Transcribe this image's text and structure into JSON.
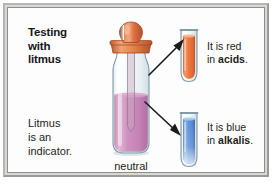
{
  "figure": {
    "title_lines": "Testing\nwith\nlitmus",
    "title_line1": "Testing",
    "title_line2": "with",
    "title_line3": "litmus",
    "subtitle_line1": "Litmus",
    "subtitle_line2": "is an",
    "subtitle_line3": "indicator.",
    "bottle_label": "neutral"
  },
  "callouts": [
    {
      "id": "acid",
      "line1": "It is red",
      "line2_prefix": "in ",
      "line2_bold": "acids",
      "line2_suffix": ".",
      "tube_name": "test-tube-red",
      "liquid_color": "#E8703A",
      "arrow": "arrow-to-red-tube"
    },
    {
      "id": "alkali",
      "line1": "It is blue",
      "line2_prefix": "in ",
      "line2_bold": "alkalis",
      "line2_suffix": ".",
      "tube_name": "test-tube-blue",
      "liquid_color": "#5B8FD6",
      "arrow": "arrow-to-blue-tube"
    }
  ],
  "colors": {
    "frame_outer": "#d9d9d4",
    "frame_border_light": "#b6b6b2",
    "frame_border_dark": "#9a9a96",
    "panel_background": "#fdfdfd",
    "bottle_liquid": "#C98BB8",
    "dropper_bulb": "#D96A3C",
    "dropper_collar": "#E08A52",
    "glass_outline": "#8aa3ad",
    "text": "#1d1d20",
    "arrow": "#1a1a1a"
  }
}
